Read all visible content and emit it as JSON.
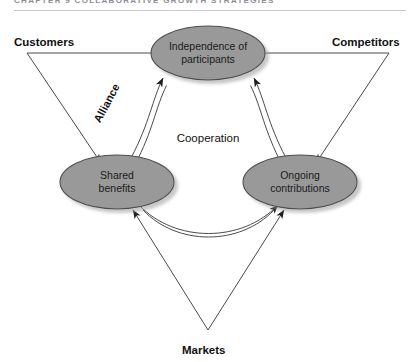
{
  "page": {
    "header_text": "CHAPTER 9    COLLABORATIVE GROWTH STRATEGIES",
    "background_color": "#ffffff"
  },
  "diagram": {
    "type": "triangle-relationship-diagram",
    "center_label": "Cooperation",
    "node_fill_color": "#999999",
    "node_stroke_color": "#4d4d4d",
    "line_color": "#4a4a4a",
    "nodes": [
      {
        "id": "independence",
        "label_line1": "Independence of",
        "label_line2": "participants",
        "cx": 208,
        "cy": 53,
        "rx": 57,
        "ry": 27
      },
      {
        "id": "shared",
        "label_line1": "Shared",
        "label_line2": "benefits",
        "cx": 117,
        "cy": 182,
        "rx": 57,
        "ry": 27
      },
      {
        "id": "ongoing",
        "label_line1": "Ongoing",
        "label_line2": "contributions",
        "cx": 300,
        "cy": 182,
        "rx": 57,
        "ry": 27
      }
    ],
    "corner_labels": [
      {
        "id": "customers",
        "text": "Customers",
        "x": 14,
        "y": 46
      },
      {
        "id": "competitors",
        "text": "Competitors",
        "x": 332,
        "y": 46
      },
      {
        "id": "markets",
        "text": "Markets",
        "x": 182,
        "y": 354
      }
    ],
    "edge_labels": [
      {
        "id": "alliance",
        "text": "Alliance",
        "x": 110,
        "y": 105,
        "rotation": -62
      }
    ],
    "triangle": {
      "vertices": [
        [
          27,
          53
        ],
        [
          389,
          53
        ],
        [
          208,
          330
        ]
      ],
      "arrowheads_point_inward": true
    },
    "curved_connectors": [
      {
        "id": "shared-independence",
        "from": "shared",
        "to": "independence",
        "bidirectional": true
      },
      {
        "id": "independence-ongoing",
        "from": "independence",
        "to": "ongoing",
        "bidirectional": true
      },
      {
        "id": "shared-ongoing",
        "from": "shared",
        "to": "ongoing",
        "bidirectional": true
      }
    ]
  }
}
